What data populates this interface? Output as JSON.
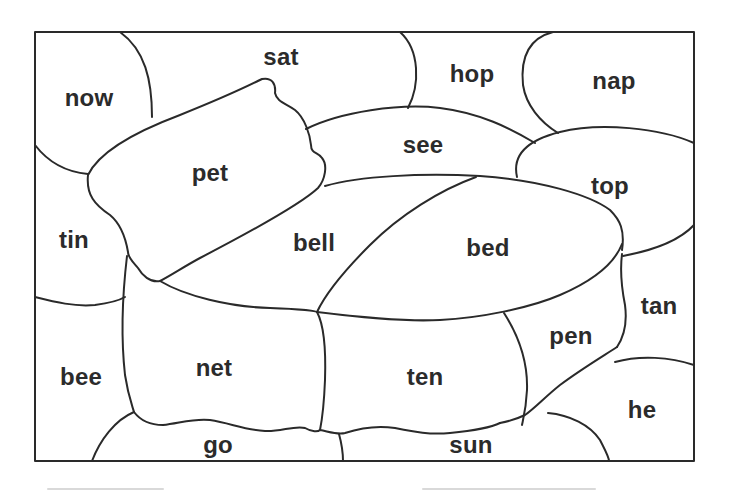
{
  "worksheet": {
    "type": "word coloring regions",
    "frame": {
      "x": 35,
      "y": 32,
      "width": 659,
      "height": 429
    },
    "line_color": "#2a2a2a",
    "background": "#ffffff",
    "regions": [
      {
        "id": "now",
        "label": "now",
        "x": 89,
        "y": 98
      },
      {
        "id": "sat",
        "label": "sat",
        "x": 281,
        "y": 57
      },
      {
        "id": "hop",
        "label": "hop",
        "x": 472,
        "y": 74
      },
      {
        "id": "nap",
        "label": "nap",
        "x": 614,
        "y": 81
      },
      {
        "id": "see",
        "label": "see",
        "x": 423,
        "y": 145
      },
      {
        "id": "pet",
        "label": "pet",
        "x": 210,
        "y": 173
      },
      {
        "id": "top",
        "label": "top",
        "x": 610,
        "y": 186
      },
      {
        "id": "tin",
        "label": "tin",
        "x": 74,
        "y": 240
      },
      {
        "id": "bell",
        "label": "bell",
        "x": 314,
        "y": 243
      },
      {
        "id": "bed",
        "label": "bed",
        "x": 488,
        "y": 248
      },
      {
        "id": "tan",
        "label": "tan",
        "x": 659,
        "y": 306
      },
      {
        "id": "pen",
        "label": "pen",
        "x": 571,
        "y": 336
      },
      {
        "id": "bee",
        "label": "bee",
        "x": 81,
        "y": 377
      },
      {
        "id": "net",
        "label": "net",
        "x": 214,
        "y": 368
      },
      {
        "id": "ten",
        "label": "ten",
        "x": 425,
        "y": 377
      },
      {
        "id": "he",
        "label": "he",
        "x": 642,
        "y": 410
      },
      {
        "id": "go",
        "label": "go",
        "x": 218,
        "y": 445
      },
      {
        "id": "sun",
        "label": "sun",
        "x": 471,
        "y": 445
      }
    ]
  }
}
